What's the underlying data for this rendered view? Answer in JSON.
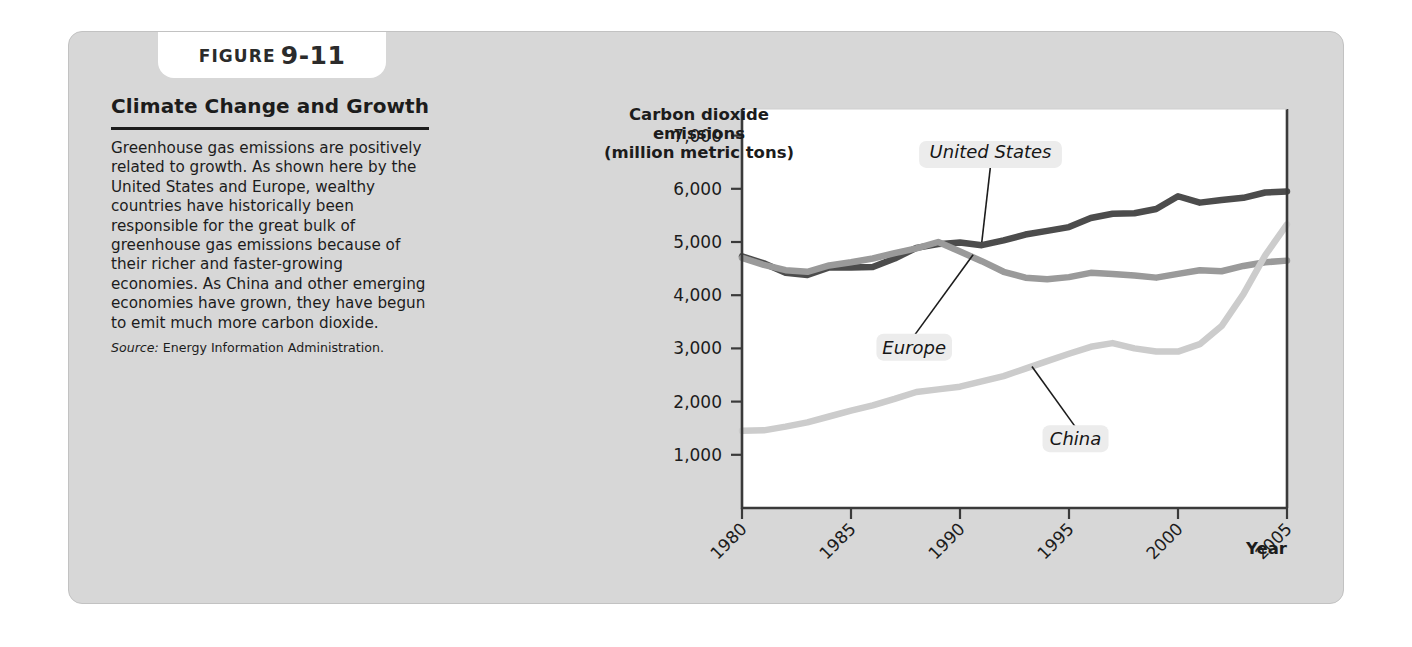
{
  "figure": {
    "tab_word": "FIGURE",
    "tab_number": "9-11",
    "title": "Climate Change and Growth",
    "body": "Greenhouse gas emissions are positively related to growth. As shown here by the United States and Europe, wealthy countries have historically been responsible for the great bulk of greenhouse gas emissions because of their richer and faster-growing economies. As China and other emerging economies have grown, they have begun to emit much more carbon dioxide.",
    "source_label": "Source:",
    "source_text": "Energy Information Administration.",
    "card_background": "#d7d7d7",
    "tab_background": "#ffffff"
  },
  "chart_data": {
    "type": "line",
    "title": "",
    "xlabel": "Year",
    "ylabel": "Carbon dioxide emissions (million metric tons)",
    "ylabel_lines": [
      "Carbon dioxide",
      "emissions",
      "(million metric tons)"
    ],
    "xlim": [
      1980,
      2005
    ],
    "ylim": [
      0,
      7500
    ],
    "yticks": [
      1000,
      2000,
      3000,
      4000,
      5000,
      6000,
      7000
    ],
    "ytick_labels": [
      "1,000",
      "2,000",
      "3,000",
      "4,000",
      "5,000",
      "6,000",
      "7,000"
    ],
    "xticks": [
      1980,
      1985,
      1990,
      1995,
      2000,
      2005
    ],
    "xtick_labels": [
      "1980",
      "1985",
      "1990",
      "1995",
      "2000",
      "2005"
    ],
    "grid": false,
    "legend_position": "inline-annotations",
    "x": [
      1980,
      1981,
      1982,
      1983,
      1984,
      1985,
      1986,
      1987,
      1988,
      1989,
      1990,
      1991,
      1992,
      1993,
      1994,
      1995,
      1996,
      1997,
      1998,
      1999,
      2000,
      2001,
      2002,
      2003,
      2004,
      2005
    ],
    "series": [
      {
        "name": "United States",
        "color": "#4c4c4c",
        "width": 6.5,
        "values": [
          4730,
          4600,
          4420,
          4380,
          4520,
          4520,
          4530,
          4690,
          4890,
          4960,
          4990,
          4940,
          5030,
          5140,
          5210,
          5280,
          5450,
          5530,
          5540,
          5620,
          5860,
          5740,
          5790,
          5830,
          5930,
          5950
        ],
        "label_x": 1991.4,
        "label_y": 6430,
        "anchor_x": 1991.0,
        "anchor_y": 5000
      },
      {
        "name": "Europe",
        "color": "#9a9a9a",
        "width": 6.5,
        "values": [
          4700,
          4570,
          4470,
          4440,
          4560,
          4620,
          4690,
          4790,
          4880,
          5000,
          4820,
          4640,
          4440,
          4330,
          4300,
          4340,
          4420,
          4400,
          4370,
          4330,
          4400,
          4470,
          4450,
          4550,
          4620,
          4650
        ],
        "label_x": 1987.9,
        "label_y": 3240,
        "anchor_x": 1990.6,
        "anchor_y": 4760
      },
      {
        "name": "China",
        "color": "#cccccc",
        "width": 6.5,
        "values": [
          1450,
          1460,
          1530,
          1610,
          1720,
          1830,
          1930,
          2050,
          2180,
          2230,
          2280,
          2380,
          2480,
          2620,
          2760,
          2900,
          3030,
          3100,
          3000,
          2940,
          2940,
          3080,
          3420,
          4020,
          4750,
          5330
        ],
        "label_x": 1995.3,
        "label_y": 1520,
        "anchor_x": 1993.3,
        "anchor_y": 2660
      }
    ]
  }
}
